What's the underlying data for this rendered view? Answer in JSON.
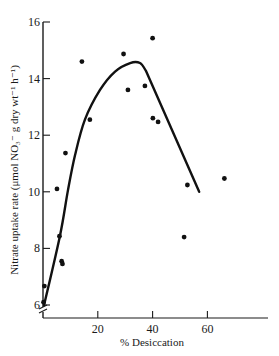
{
  "chart_data": {
    "type": "scatter",
    "title": "",
    "xlabel": "% Desiccation",
    "ylabel": "Nitrate uptake rate (μmol NO₃⁻ g dry wt⁻¹ h⁻¹)",
    "xlim": [
      0,
      80
    ],
    "ylim": [
      6,
      16
    ],
    "x_ticks": [
      20,
      40,
      60
    ],
    "y_ticks": [
      6,
      8,
      10,
      12,
      14,
      16
    ],
    "grid": false,
    "legend": null,
    "y_axis_break": true,
    "series": [
      {
        "name": "observations",
        "kind": "points",
        "x": [
          0.2,
          0.5,
          5.1,
          6.0,
          6.8,
          7.1,
          8.2,
          14.2,
          17.1,
          29.4,
          31.0,
          37.2,
          40.0,
          40.1,
          42.0,
          51.5,
          52.7,
          66.2
        ],
        "y": [
          6.1,
          6.67,
          10.1,
          8.43,
          7.55,
          7.45,
          11.37,
          14.6,
          12.55,
          14.87,
          13.6,
          13.74,
          15.43,
          12.6,
          12.47,
          8.4,
          10.24,
          10.47
        ]
      },
      {
        "name": "fitted curve",
        "kind": "line",
        "x": [
          0.4,
          6.2,
          9.1,
          11.7,
          15.3,
          20.8,
          26.3,
          31.8,
          35.4,
          37.6,
          57.0
        ],
        "y": [
          6.0,
          8.45,
          10.05,
          11.3,
          12.55,
          13.6,
          14.25,
          14.55,
          14.55,
          14.27,
          10.0
        ]
      }
    ]
  }
}
